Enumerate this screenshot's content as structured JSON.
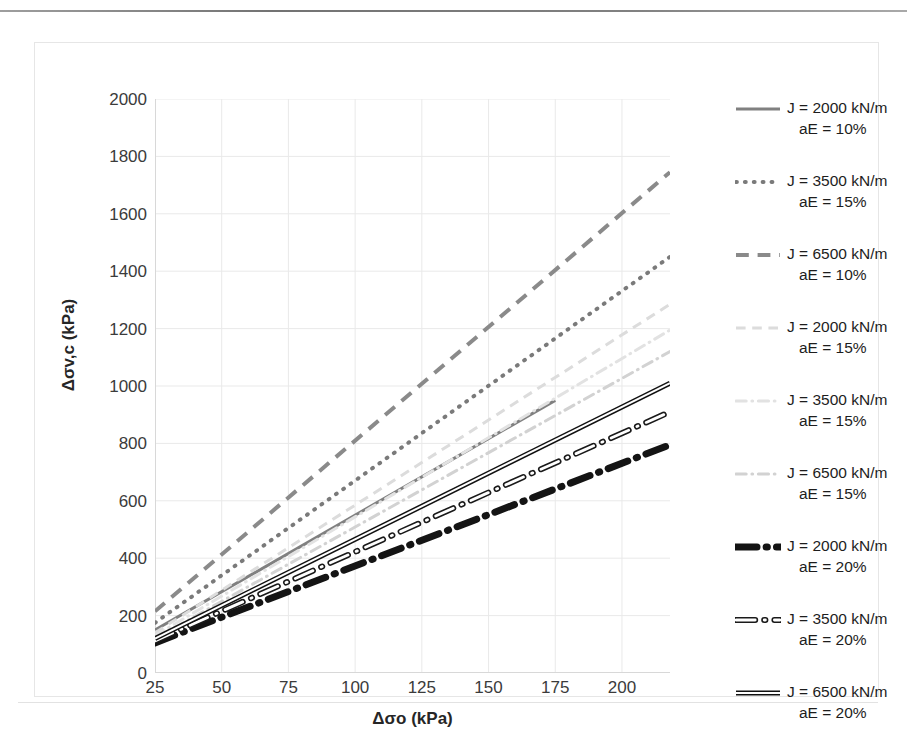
{
  "chart_data": {
    "type": "line",
    "title": "",
    "xlabel": "Δσo (kPa)",
    "ylabel": "Δσv,c (kPa)",
    "xlim": [
      25,
      218
    ],
    "ylim": [
      0,
      2000
    ],
    "xticks": [
      25,
      50,
      75,
      100,
      125,
      150,
      175,
      200
    ],
    "yticks": [
      0,
      200,
      400,
      600,
      800,
      1000,
      1200,
      1400,
      1600,
      1800,
      2000
    ],
    "grid": true,
    "legend_position": "right",
    "series": [
      {
        "name": "J = 2000 kN/m aE = 10%",
        "label_line1": "J = 2000 kN/m",
        "label_line2": "aE = 10%",
        "style": "solid",
        "color": "#808080",
        "width": 3,
        "x": [
          25,
          175
        ],
        "y": [
          150,
          950
        ]
      },
      {
        "name": "J = 3500 kN/m aE = 15%",
        "label_line1": "J = 3500 kN/m",
        "label_line2": "aE = 15%",
        "style": "dotted",
        "color": "#7a7a7a",
        "width": 4,
        "x": [
          25,
          218
        ],
        "y": [
          175,
          1450
        ]
      },
      {
        "name": "J = 6500 kN/m aE = 10%",
        "label_line1": "J = 6500 kN/m",
        "label_line2": "aE = 10%",
        "style": "dashed",
        "color": "#8a8a8a",
        "width": 4,
        "x": [
          25,
          218
        ],
        "y": [
          215,
          1745
        ]
      },
      {
        "name": "J = 2000 kN/m aE = 15%",
        "label_line1": "J = 2000 kN/m",
        "label_line2": "aE = 15%",
        "style": "dashed",
        "color": "#dcdcdc",
        "width": 3,
        "x": [
          25,
          218
        ],
        "y": [
          140,
          1285
        ]
      },
      {
        "name": "J = 3500 kN/m aE = 15%",
        "label_line1": "J = 3500 kN/m",
        "label_line2": "aE = 15%",
        "style": "dashdot",
        "color": "#e2e2e2",
        "width": 3,
        "x": [
          25,
          218
        ],
        "y": [
          130,
          1195
        ]
      },
      {
        "name": "J = 6500 kN/m aE = 15%",
        "label_line1": "J = 6500 kN/m",
        "label_line2": "aE = 15%",
        "style": "dashdot",
        "color": "#d2d2d2",
        "width": 3,
        "x": [
          25,
          218
        ],
        "y": [
          120,
          1120
        ]
      },
      {
        "name": "J = 2000 kN/m aE = 20%",
        "label_line1": "J = 2000 kN/m",
        "label_line2": "aE = 20%",
        "style": "dashdot-thick",
        "color": "#141414",
        "width": 7,
        "x": [
          25,
          218
        ],
        "y": [
          105,
          795
        ]
      },
      {
        "name": "J = 3500 kN/m aE = 20%",
        "label_line1": "J = 3500 kN/m",
        "label_line2": "aE = 20%",
        "style": "dashdot-outline",
        "color": "#1a1a1a",
        "width": 6,
        "x": [
          25,
          218
        ],
        "y": [
          112,
          910
        ]
      },
      {
        "name": "J = 6500 kN/m aE = 20%",
        "label_line1": "J = 6500 kN/m",
        "label_line2": "aE = 20%",
        "style": "solid-double",
        "color": "#111111",
        "width": 5,
        "x": [
          25,
          218
        ],
        "y": [
          120,
          1010
        ]
      }
    ]
  },
  "axes": {
    "y_labels": [
      "2000",
      "1800",
      "1600",
      "1400",
      "1200",
      "1000",
      "800",
      "600",
      "400",
      "200",
      "0"
    ],
    "x_labels": [
      "25",
      "50",
      "75",
      "100",
      "125",
      "150",
      "175",
      "200"
    ],
    "x_title": "Δσo (kPa)",
    "y_title": "Δσv,c (kPa)"
  },
  "legend": {
    "entries": [
      {
        "line1": "J = 2000 kN/m",
        "line2": "aE = 10%"
      },
      {
        "line1": "J = 3500 kN/m",
        "line2": "aE = 15%"
      },
      {
        "line1": "J = 6500 kN/m",
        "line2": "aE = 10%"
      },
      {
        "line1": "J = 2000 kN/m",
        "line2": "aE = 15%"
      },
      {
        "line1": "J = 3500 kN/m",
        "line2": "aE = 15%"
      },
      {
        "line1": "J = 6500 kN/m",
        "line2": "aE = 15%"
      },
      {
        "line1": "J = 2000 kN/m",
        "line2": "aE = 20%"
      },
      {
        "line1": "J = 3500 kN/m",
        "line2": "aE = 20%"
      },
      {
        "line1": "J = 6500 kN/m",
        "line2": "aE = 20%"
      }
    ]
  },
  "colors": {
    "grid": "#e9e9e9",
    "axis_text": "#3b3b3b",
    "title_text": "#262626",
    "frame": "#e6e6e6"
  }
}
